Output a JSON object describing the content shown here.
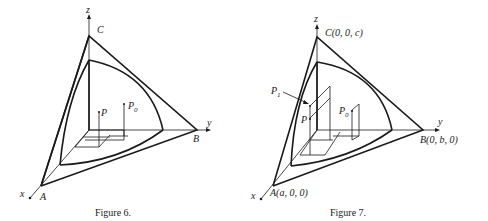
{
  "figures": [
    {
      "id": "figure-6",
      "caption": "Figure 6.",
      "axes": {
        "x": "x",
        "y": "y",
        "z": "z"
      },
      "vertices": {
        "A": "A",
        "B": "B",
        "C": "C"
      },
      "points": {
        "P": "P",
        "P0_base": "P",
        "P0_sub": "0"
      }
    },
    {
      "id": "figure-7",
      "caption": "Figure 7.",
      "axes": {
        "x": "x",
        "y": "y",
        "z": "z"
      },
      "vertices": {
        "A": "A(a, 0, 0)",
        "B": "B(0, b, 0)",
        "C": "C(0, 0, c)"
      },
      "points": {
        "P": "P",
        "P0_base": "P",
        "P0_sub": "0",
        "P1_base": "P",
        "P1_sub": "1"
      }
    }
  ]
}
